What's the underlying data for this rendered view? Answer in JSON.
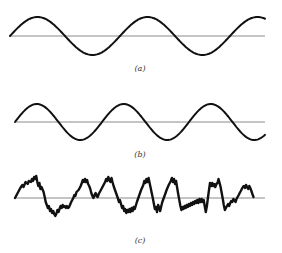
{
  "figure": {
    "panels": [
      {
        "id": "a",
        "label": "(a)",
        "description": "Pure sine wave, longer period",
        "axis": {
          "x1": 10,
          "x2": 265,
          "y": 36
        },
        "wave": {
          "type": "sine",
          "x_start": 10,
          "x_end": 265,
          "amplitude": 19,
          "period": 110,
          "phase_sign": 1
        },
        "label_pos": {
          "x": 140,
          "y": 71
        }
      },
      {
        "id": "b",
        "label": "(b)",
        "description": "Pure sine wave, shorter period",
        "axis": {
          "x1": 15,
          "x2": 265,
          "y": 122
        },
        "wave": {
          "type": "sine",
          "x_start": 15,
          "x_end": 265,
          "amplitude": 18,
          "period": 87,
          "phase_sign": 1
        },
        "label_pos": {
          "x": 140,
          "y": 157
        }
      },
      {
        "id": "c",
        "label": "(c)",
        "description": "Noisy / random fluctuating waveform",
        "axis": {
          "x1": 15,
          "x2": 265,
          "y": 198
        },
        "wave": {
          "type": "polyline",
          "points": [
            [
              15,
              198
            ],
            [
              18,
              192
            ],
            [
              20,
              188
            ],
            [
              22,
              185
            ],
            [
              23,
              187
            ],
            [
              25,
              182
            ],
            [
              27,
              184
            ],
            [
              28,
              181
            ],
            [
              30,
              182
            ],
            [
              31,
              179
            ],
            [
              32,
              181
            ],
            [
              33,
              177
            ],
            [
              34,
              179
            ],
            [
              35,
              176
            ],
            [
              36,
              182
            ],
            [
              37,
              186
            ],
            [
              38,
              183
            ],
            [
              39,
              189
            ],
            [
              40,
              187
            ],
            [
              42,
              192
            ],
            [
              43,
              197
            ],
            [
              44,
              202
            ],
            [
              45,
              205
            ],
            [
              46,
              208
            ],
            [
              47,
              206
            ],
            [
              48,
              211
            ],
            [
              49,
              209
            ],
            [
              50,
              213
            ],
            [
              51,
              211
            ],
            [
              52,
              214
            ],
            [
              53,
              216
            ],
            [
              54,
              214
            ],
            [
              55,
              210
            ],
            [
              56,
              212
            ],
            [
              57,
              209
            ],
            [
              58,
              206
            ],
            [
              59,
              208
            ],
            [
              60,
              205
            ],
            [
              61,
              207
            ],
            [
              62,
              206
            ],
            [
              63,
              208
            ],
            [
              64,
              206
            ],
            [
              65,
              208
            ],
            [
              66,
              207
            ],
            [
              68,
              202
            ],
            [
              70,
              198
            ],
            [
              71,
              195
            ],
            [
              72,
              196
            ],
            [
              73,
              192
            ],
            [
              75,
              190
            ],
            [
              77,
              186
            ],
            [
              78,
              183
            ],
            [
              79,
              180
            ],
            [
              80,
              182
            ],
            [
              81,
              179
            ],
            [
              82,
              182
            ],
            [
              83,
              180
            ],
            [
              84,
              184
            ],
            [
              85,
              186
            ],
            [
              86,
              189
            ],
            [
              87,
              193
            ],
            [
              88,
              196
            ],
            [
              89,
              198
            ],
            [
              90,
              195
            ],
            [
              91,
              193
            ],
            [
              92,
              196
            ],
            [
              93,
              197
            ],
            [
              94,
              194
            ],
            [
              96,
              190
            ],
            [
              98,
              186
            ],
            [
              100,
              182
            ],
            [
              101,
              179
            ],
            [
              102,
              181
            ],
            [
              103,
              177
            ],
            [
              104,
              180
            ],
            [
              105,
              182
            ],
            [
              106,
              178
            ],
            [
              107,
              182
            ],
            [
              108,
              186
            ],
            [
              110,
              192
            ],
            [
              112,
              198
            ],
            [
              113,
              202
            ],
            [
              114,
              200
            ],
            [
              115,
              204
            ],
            [
              116,
              208
            ],
            [
              117,
              206
            ],
            [
              118,
              211
            ],
            [
              119,
              209
            ],
            [
              120,
              213
            ],
            [
              121,
              210
            ],
            [
              122,
              212
            ],
            [
              123,
              209
            ],
            [
              124,
              212
            ],
            [
              125,
              208
            ],
            [
              126,
              211
            ],
            [
              127,
              207
            ],
            [
              128,
              209
            ],
            [
              130,
              202
            ],
            [
              132,
              196
            ],
            [
              134,
              190
            ],
            [
              136,
              185
            ],
            [
              137,
              181
            ],
            [
              138,
              183
            ],
            [
              139,
              179
            ],
            [
              140,
              182
            ],
            [
              141,
              178
            ],
            [
              142,
              183
            ],
            [
              143,
              188
            ],
            [
              144,
              193
            ],
            [
              145,
              198
            ],
            [
              146,
              204
            ],
            [
              147,
              209
            ],
            [
              148,
              207
            ],
            [
              149,
              212
            ],
            [
              150,
              205
            ],
            [
              151,
              208
            ],
            [
              152,
              211
            ],
            [
              153,
              206
            ],
            [
              154,
              202
            ],
            [
              156,
              196
            ],
            [
              158,
              190
            ],
            [
              160,
              185
            ],
            [
              162,
              181
            ],
            [
              163,
              178
            ],
            [
              164,
              182
            ],
            [
              165,
              179
            ],
            [
              166,
              184
            ],
            [
              167,
              181
            ],
            [
              168,
              188
            ],
            [
              169,
              194
            ],
            [
              170,
              200
            ],
            [
              171,
              206
            ],
            [
              172,
              210
            ],
            [
              173,
              207
            ],
            [
              174,
              209
            ],
            [
              175,
              206
            ],
            [
              176,
              208
            ],
            [
              177,
              205
            ],
            [
              178,
              207
            ],
            [
              179,
              204
            ],
            [
              180,
              206
            ],
            [
              181,
              203
            ],
            [
              182,
              205
            ],
            [
              183,
              202
            ],
            [
              184,
              204
            ],
            [
              185,
              201
            ],
            [
              186,
              203
            ],
            [
              187,
              200
            ],
            [
              188,
              203
            ],
            [
              189,
              199
            ],
            [
              190,
              202
            ],
            [
              191,
              199
            ],
            [
              192,
              202
            ],
            [
              193,
              200
            ],
            [
              194,
              206
            ],
            [
              195,
              212
            ],
            [
              196,
              206
            ],
            [
              197,
              198
            ],
            [
              198,
              190
            ],
            [
              199,
              183
            ],
            [
              200,
              186
            ],
            [
              201,
              183
            ],
            [
              202,
              186
            ],
            [
              203,
              184
            ],
            [
              204,
              187
            ],
            [
              205,
              184
            ],
            [
              206,
              183
            ],
            [
              207,
              179
            ],
            [
              208,
              183
            ],
            [
              209,
              187
            ],
            [
              210,
              193
            ],
            [
              211,
              199
            ],
            [
              212,
              205
            ],
            [
              213,
              210
            ],
            [
              214,
              208
            ],
            [
              215,
              206
            ],
            [
              216,
              204
            ],
            [
              217,
              206
            ],
            [
              218,
              203
            ],
            [
              219,
              201
            ],
            [
              220,
              202
            ],
            [
              221,
              199
            ],
            [
              222,
              200
            ],
            [
              223,
              202
            ],
            [
              224,
              199
            ],
            [
              225,
              197
            ],
            [
              226,
              195
            ],
            [
              227,
              193
            ],
            [
              228,
              191
            ],
            [
              229,
              189
            ],
            [
              230,
              187
            ],
            [
              231,
              186
            ],
            [
              232,
              188
            ],
            [
              233,
              185
            ],
            [
              234,
              187
            ],
            [
              235,
              189
            ],
            [
              236,
              186
            ],
            [
              237,
              188
            ],
            [
              238,
              191
            ],
            [
              239,
              194
            ],
            [
              240,
              197
            ]
          ],
          "x_scale": 1.06,
          "x_offset": 0
        },
        "label_pos": {
          "x": 140,
          "y": 243
        }
      }
    ],
    "colors": {
      "background": "#ffffff",
      "wave": "#111111",
      "axis": "#8a8a8a",
      "label": "#333333"
    }
  }
}
